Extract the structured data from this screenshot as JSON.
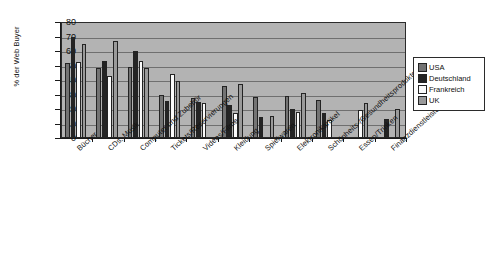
{
  "chart_data": {
    "type": "bar",
    "title": "",
    "xlabel": "",
    "ylabel": "% der Web Buyer",
    "ylim": [
      0,
      80
    ],
    "ytick_values": [
      80,
      70,
      60,
      50,
      40,
      30,
      20,
      10,
      0
    ],
    "grid": true,
    "legend_position": "right",
    "categories": [
      "Bücher",
      "CDs, Musik",
      "Computer und Zubehör",
      "Tickets/Reservierungen",
      "Videos/Filme",
      "Kleidung",
      "Spielwaren",
      "Elektronikartikel",
      "Schönheits-/Gesundheitsprodukte",
      "Essen/Trinken",
      "Finanzdienstleistungen"
    ],
    "series": [
      {
        "name": "USA",
        "color": "#737373",
        "values": [
          52,
          48.5,
          49,
          29.5,
          27.5,
          36,
          28.5,
          29,
          26,
          0,
          0
        ]
      },
      {
        "name": "Deutschland",
        "color": "#242424",
        "values": [
          70,
          53,
          60,
          25.5,
          24.5,
          22.5,
          14.5,
          20,
          17.5,
          0,
          13
        ]
      },
      {
        "name": "Frankreich",
        "color": "#fbfbfb",
        "values": [
          52.5,
          42.5,
          53,
          44,
          24,
          17,
          0,
          18,
          12.5,
          19,
          0
        ]
      },
      {
        "name": "UK",
        "color": "#9a9a9a",
        "values": [
          65,
          67,
          48,
          39,
          0,
          37.5,
          15.5,
          31,
          0,
          24,
          20
        ]
      }
    ]
  },
  "legend": {
    "items": [
      {
        "label": "USA"
      },
      {
        "label": "Deutschland"
      },
      {
        "label": "Frankreich"
      },
      {
        "label": "UK"
      }
    ]
  }
}
